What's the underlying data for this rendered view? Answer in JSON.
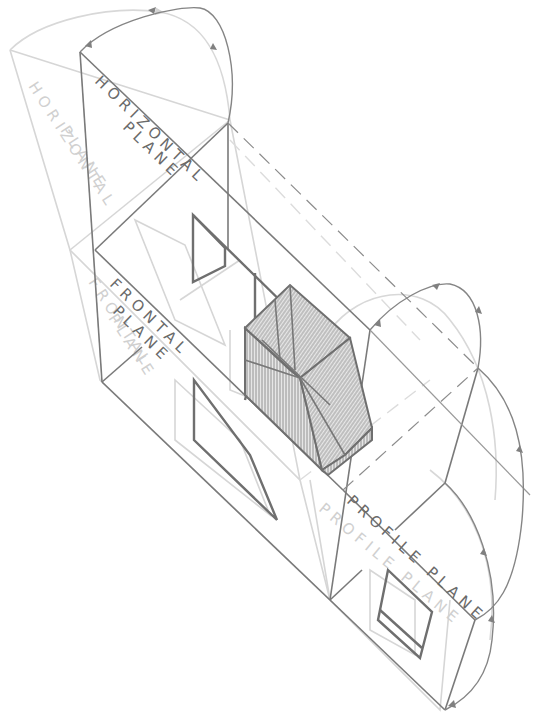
{
  "diagram": {
    "type": "isometric-projection-planes",
    "labels": {
      "horizontal_line1": "HORIZONTAL",
      "horizontal_line2": "PLANE",
      "frontal_line1": "FRONTAL",
      "frontal_line2": "PLANE",
      "profile": "PROFILE PLANE",
      "ghost_horizontal_line1": "HORIZONTAL",
      "ghost_horizontal_line2": "PLANE",
      "ghost_frontal_line1": "FRONTAL",
      "ghost_frontal_line2": "PLANE",
      "ghost_profile": "PROFILE PLANE"
    },
    "colors": {
      "main_line": "#7a7a7a",
      "ghost_line": "#d6d6d6",
      "hatch": "#8a8a8a",
      "background": "#ffffff"
    },
    "elements": {
      "planes": [
        "horizontal-plane",
        "frontal-plane",
        "profile-plane"
      ],
      "object": "hatched-isometric-solid",
      "projections": [
        "top-view",
        "front-view",
        "side-view"
      ],
      "rotation_arcs": 3
    }
  }
}
